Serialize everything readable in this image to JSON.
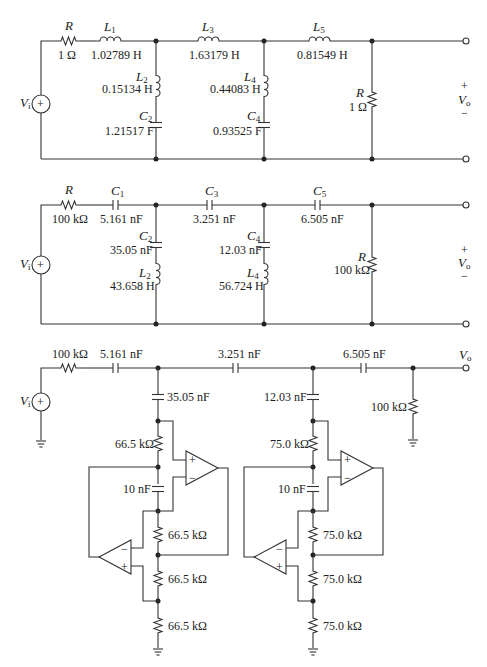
{
  "figure": {
    "circuit1": {
      "source": "V",
      "source_sub": "i",
      "output": "V",
      "output_sub": "o",
      "plus": "+",
      "minus": "−",
      "R_in_name": "R",
      "R_in_val": "1 Ω",
      "L1_name": "L",
      "L1_sub": "1",
      "L1_val": "1.02789 H",
      "L3_name": "L",
      "L3_sub": "3",
      "L3_val": "1.63179 H",
      "L5_name": "L",
      "L5_sub": "5",
      "L5_val": "0.81549 H",
      "L2_name": "L",
      "L2_sub": "2",
      "L2_val": "0.15134 H",
      "C2_name": "C",
      "C2_sub": "2",
      "C2_val": "1.21517 F",
      "L4_name": "L",
      "L4_sub": "4",
      "L4_val": "0.44083 H",
      "C4_name": "C",
      "C4_sub": "4",
      "C4_val": "0.93525 F",
      "R_load_name": "R",
      "R_load_val": "1 Ω"
    },
    "circuit2": {
      "source": "V",
      "source_sub": "i",
      "output": "V",
      "output_sub": "o",
      "plus": "+",
      "minus": "−",
      "R_in_name": "R",
      "R_in_val": "100 kΩ",
      "C1_name": "C",
      "C1_sub": "1",
      "C1_val": "5.161 nF",
      "C3_name": "C",
      "C3_sub": "3",
      "C3_val": "3.251 nF",
      "C5_name": "C",
      "C5_sub": "5",
      "C5_val": "6.505 nF",
      "C2_name": "C",
      "C2_sub": "2",
      "C2_val": "35.05 nF",
      "L2_name": "L",
      "L2_sub": "2",
      "L2_val": "43.658 H",
      "C4_name": "C",
      "C4_sub": "4",
      "C4_val": "12.03 nF",
      "L4_name": "L",
      "L4_sub": "4",
      "L4_val": "56.724 H",
      "R_load_name": "R",
      "R_load_val": "100 kΩ"
    },
    "circuit3": {
      "source": "V",
      "source_sub": "i",
      "output": "V",
      "output_sub": "o",
      "R_in_val": "100 kΩ",
      "C1_val": "5.161 nF",
      "C3_val": "3.251 nF",
      "C5_val": "6.505 nF",
      "R_load_val": "100 kΩ",
      "gic1": {
        "C_top": "35.05 nF",
        "R1": "66.5 kΩ",
        "C": "10 nF",
        "R2": "66.5 kΩ",
        "R3": "66.5 kΩ",
        "R4": "66.5 kΩ"
      },
      "gic2": {
        "C_top": "12.03 nF",
        "R1": "75.0 kΩ",
        "C": "10 nF",
        "R2": "75.0 kΩ",
        "R3": "75.0 kΩ",
        "R4": "75.0 kΩ"
      },
      "opamp_plus": "+",
      "opamp_minus": "−"
    }
  }
}
